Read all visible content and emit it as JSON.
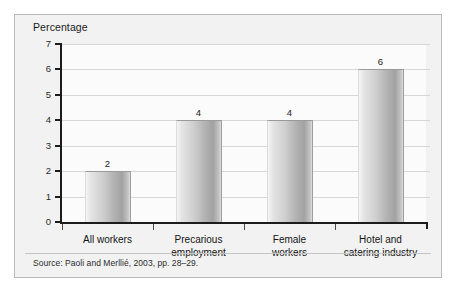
{
  "figure": {
    "axis_title": "Percentage",
    "source": "Source: Paoli and Merllié, 2003, pp. 28–29.",
    "background_color": "#f2f2f2",
    "plot_background_color": "#fbfbfb",
    "border_color": "#b9b9b9",
    "bar_color": "#b4b4b4",
    "gridline_color": "#d7d7d7",
    "axis_color": "#1c1c1c"
  },
  "chart_data": {
    "type": "bar",
    "title": "",
    "subtitle": "",
    "xlabel": "",
    "ylabel": "Percentage",
    "categories": [
      "All workers",
      "Precarious employment",
      "Female workers",
      "Hotel and catering industry"
    ],
    "category_lines": [
      [
        "All workers",
        ""
      ],
      [
        "Precarious",
        "employment"
      ],
      [
        "Female",
        "workers"
      ],
      [
        "Hotel and",
        "catering industry"
      ]
    ],
    "values": [
      2,
      4,
      4,
      6
    ],
    "value_labels": [
      "2",
      "4",
      "4",
      "6"
    ],
    "ylim": [
      0,
      7
    ],
    "ytick_values": [
      7,
      6,
      5,
      4,
      3,
      2,
      1,
      0
    ],
    "ytick_labels": [
      "7",
      "6",
      "5",
      "4",
      "3",
      "2",
      "1",
      "0"
    ],
    "grid": true,
    "grid_axis": "y",
    "legend": false,
    "legend_position": "none"
  }
}
